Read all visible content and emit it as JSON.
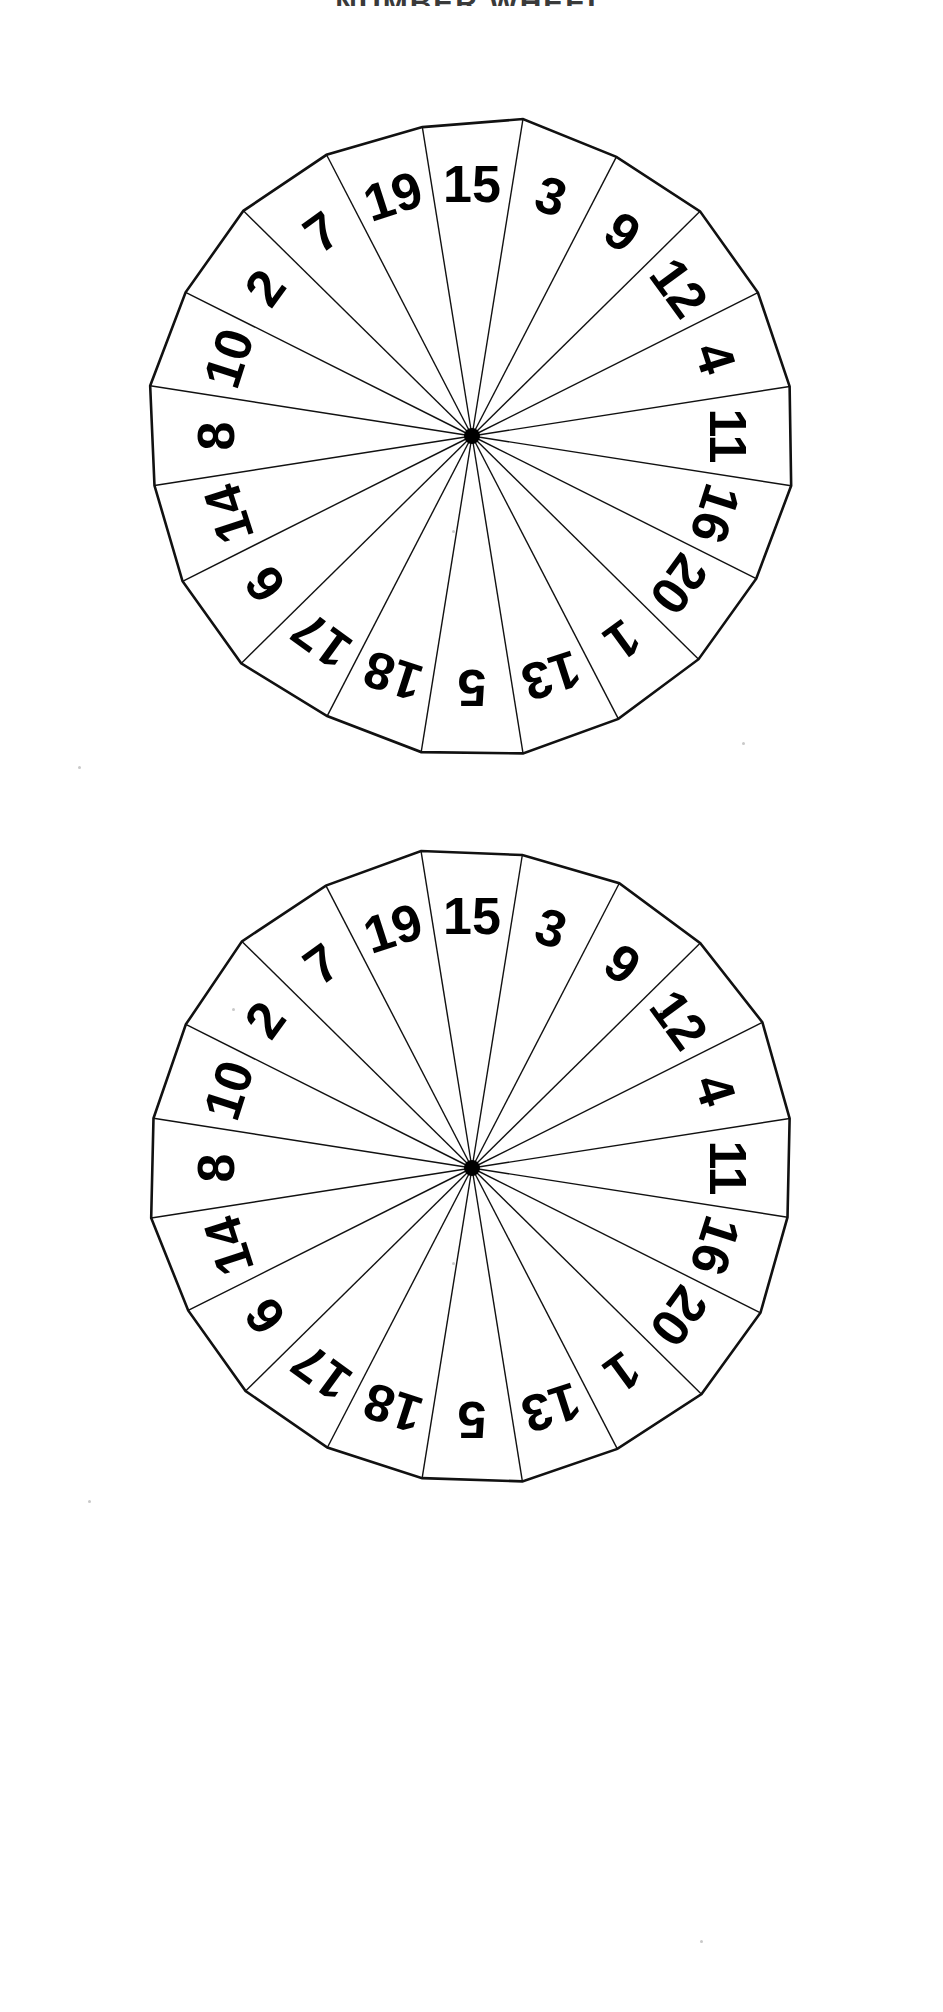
{
  "page": {
    "title": "NUMBER WHEEL",
    "background_color": "#ffffff",
    "ink_color": "#000000",
    "width": 943,
    "height": 2012
  },
  "wheels": [
    {
      "name": "number-wheel-top",
      "center_x": 372,
      "center_y": 434,
      "radius": 322,
      "sector_count": 20,
      "numbers": [
        15,
        3,
        9,
        12,
        4,
        11,
        16,
        20,
        1,
        13,
        5,
        18,
        17,
        6,
        14,
        8,
        10,
        2,
        7,
        19
      ]
    },
    {
      "name": "number-wheel-bottom",
      "center_x": 372,
      "center_y": 1166,
      "radius": 322,
      "sector_count": 20,
      "numbers": [
        15,
        3,
        9,
        12,
        4,
        11,
        16,
        20,
        1,
        13,
        5,
        18,
        17,
        6,
        14,
        8,
        10,
        2,
        7,
        19
      ]
    }
  ],
  "chart_data": {
    "type": "pie",
    "title": "NUMBER WHEEL",
    "xlabel": "",
    "ylabel": "",
    "categories": [
      "15",
      "3",
      "9",
      "12",
      "4",
      "11",
      "16",
      "20",
      "1",
      "13",
      "5",
      "18",
      "17",
      "6",
      "14",
      "8",
      "10",
      "2",
      "7",
      "19"
    ],
    "values": [
      5,
      5,
      5,
      5,
      5,
      5,
      5,
      5,
      5,
      5,
      5,
      5,
      5,
      5,
      5,
      5,
      5,
      5,
      5,
      5
    ],
    "series": [
      {
        "name": "wheel-1-sectors",
        "values": [
          5,
          5,
          5,
          5,
          5,
          5,
          5,
          5,
          5,
          5,
          5,
          5,
          5,
          5,
          5,
          5,
          5,
          5,
          5,
          5
        ]
      },
      {
        "name": "wheel-2-sectors",
        "values": [
          5,
          5,
          5,
          5,
          5,
          5,
          5,
          5,
          5,
          5,
          5,
          5,
          5,
          5,
          5,
          5,
          5,
          5,
          5,
          5
        ]
      }
    ],
    "legend_position": "none",
    "grid": false,
    "annotations": [
      "Two identical 20-sector number wheels",
      "Each sector is 18 degrees",
      "Numbers 1 through 20 each appear exactly once per wheel",
      "Labels read outward from the hub so the upper half appears inverted"
    ]
  }
}
